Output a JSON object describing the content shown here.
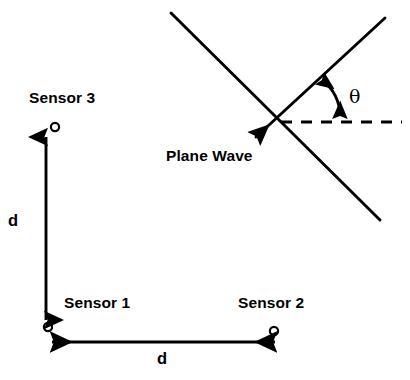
{
  "diagram": {
    "background_color": "#ffffff",
    "stroke_color": "#000000",
    "width": 410,
    "height": 380
  },
  "labels": {
    "sensor1": "Sensor 1",
    "sensor2": "Sensor 2",
    "sensor3": "Sensor 3",
    "plane_wave": "Plane Wave",
    "theta": "θ",
    "distance_vertical": "d",
    "distance_horizontal": "d"
  },
  "sensors": [
    {
      "name": "Sensor 1",
      "x": 48,
      "y": 327,
      "marker": "open-circle"
    },
    {
      "name": "Sensor 2",
      "x": 274,
      "y": 331,
      "marker": "open-circle"
    },
    {
      "name": "Sensor 3",
      "x": 55,
      "y": 127,
      "marker": "open-circle"
    }
  ],
  "measurements": [
    {
      "label": "d",
      "orientation": "vertical",
      "between": [
        "Sensor 1",
        "Sensor 3"
      ],
      "arrow": "double-headed",
      "from": {
        "x": 46,
        "y": 131
      },
      "to": {
        "x": 46,
        "y": 326
      }
    },
    {
      "label": "d",
      "orientation": "horizontal",
      "between": [
        "Sensor 1",
        "Sensor 2"
      ],
      "arrow": "double-headed",
      "from": {
        "x": 46,
        "y": 342
      },
      "to": {
        "x": 281,
        "y": 342
      }
    }
  ],
  "wave": {
    "wavefront_line": {
      "x1": 171,
      "y1": 13,
      "x2": 380,
      "y2": 220,
      "style": "solid"
    },
    "propagation_ray": {
      "x1": 385,
      "y1": 18,
      "x2": 252,
      "y2": 140,
      "style": "solid",
      "arrow": "end"
    },
    "reference_line": {
      "x1": 281,
      "y1": 122,
      "x2": 402,
      "y2": 122,
      "style": "dashed"
    },
    "intersection": {
      "x": 278,
      "y": 118
    },
    "angle_arc": {
      "label": "θ",
      "arrow": "double-headed",
      "from": {
        "x": 319,
        "y": 77
      },
      "to": {
        "x": 341,
        "y": 120
      }
    }
  }
}
